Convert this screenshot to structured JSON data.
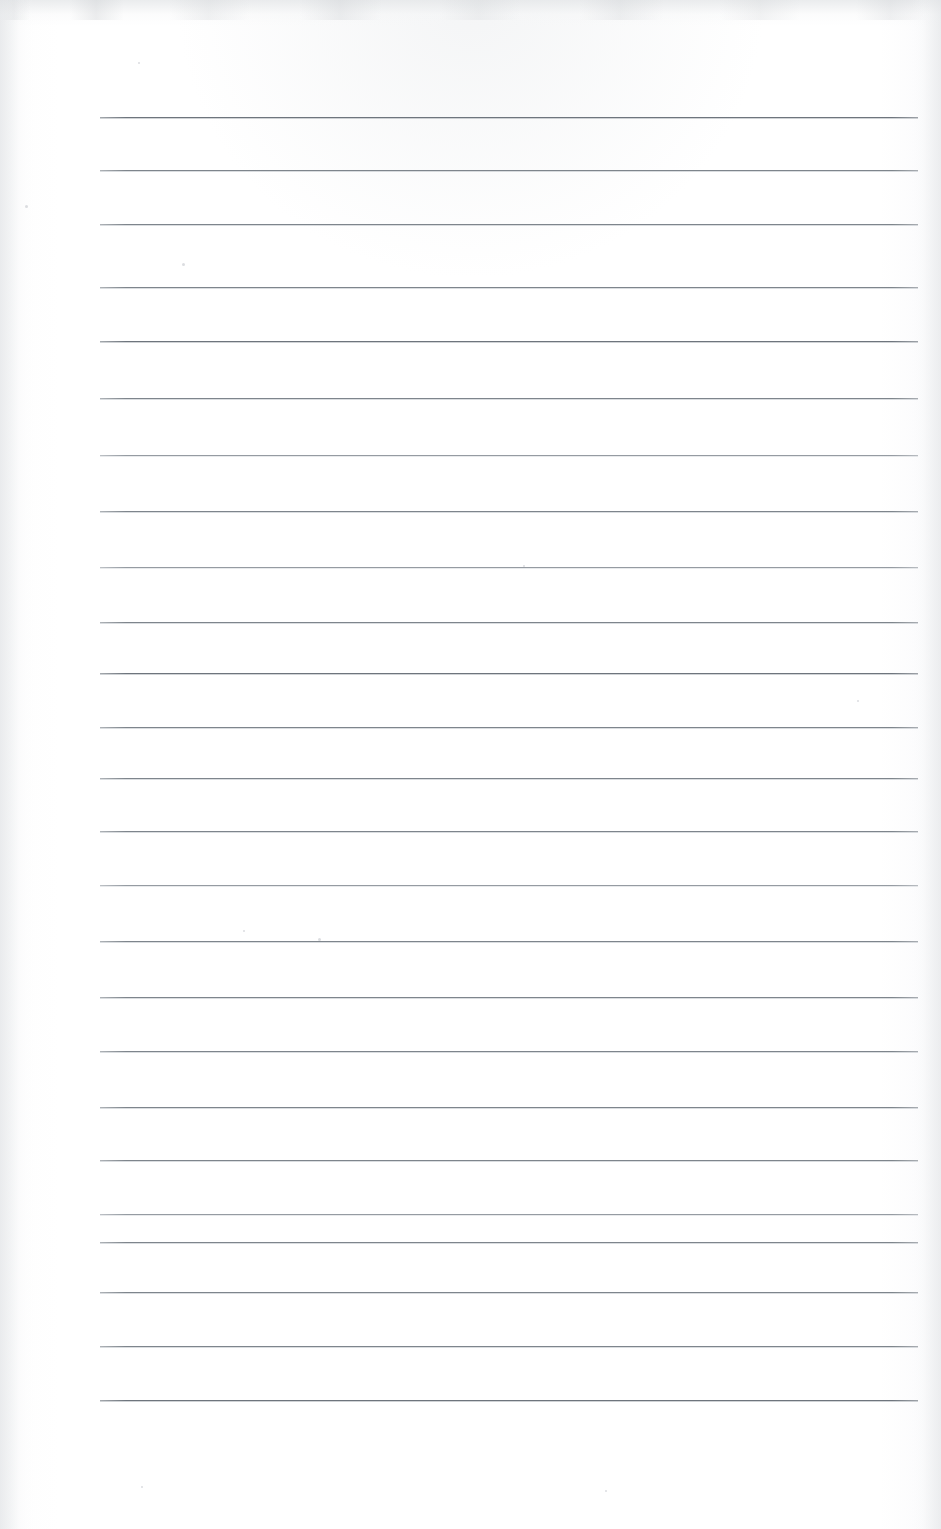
{
  "document": {
    "kind": "scanned-page",
    "content_type": "blank ruled notebook paper",
    "page_width_px": 941,
    "page_height_px": 1529,
    "paper_color": "#fdfdfd",
    "handwriting_present": "none",
    "printed_text_present": "none",
    "visible_text": ""
  },
  "ruling": {
    "line_color": "#7e858c",
    "line_thickness_px": 1,
    "line_count": 25,
    "line_start_x_px": 100,
    "line_end_x_px": 918,
    "line_length_px": 818,
    "first_line_y_px": 117,
    "last_line_y_px": 1400,
    "line_spacing_px": 53.5,
    "margin_rule_present": "none",
    "lines": [
      {
        "index": 1,
        "y": 117,
        "tone": "darker"
      },
      {
        "index": 2,
        "y": 170,
        "tone": "normal"
      },
      {
        "index": 3,
        "y": 224,
        "tone": "normal"
      },
      {
        "index": 4,
        "y": 287,
        "tone": "normal"
      },
      {
        "index": 5,
        "y": 341,
        "tone": "darker"
      },
      {
        "index": 6,
        "y": 398,
        "tone": "normal"
      },
      {
        "index": 7,
        "y": 455,
        "tone": "lighter"
      },
      {
        "index": 8,
        "y": 511,
        "tone": "normal"
      },
      {
        "index": 9,
        "y": 567,
        "tone": "lighter"
      },
      {
        "index": 10,
        "y": 622,
        "tone": "normal"
      },
      {
        "index": 11,
        "y": 673,
        "tone": "darker"
      },
      {
        "index": 12,
        "y": 727,
        "tone": "normal"
      },
      {
        "index": 13,
        "y": 778,
        "tone": "normal"
      },
      {
        "index": 14,
        "y": 831,
        "tone": "normal"
      },
      {
        "index": 15,
        "y": 885,
        "tone": "lighter"
      },
      {
        "index": 16,
        "y": 941,
        "tone": "normal"
      },
      {
        "index": 17,
        "y": 997,
        "tone": "normal"
      },
      {
        "index": 18,
        "y": 1051,
        "tone": "normal"
      },
      {
        "index": 19,
        "y": 1107,
        "tone": "normal"
      },
      {
        "index": 20,
        "y": 1160,
        "tone": "normal"
      },
      {
        "index": 21,
        "y": 1214,
        "tone": "lighter"
      },
      {
        "index": 22,
        "y": 1242,
        "tone": "normal"
      },
      {
        "index": 23,
        "y": 1292,
        "tone": "normal"
      },
      {
        "index": 24,
        "y": 1346,
        "tone": "normal"
      },
      {
        "index": 25,
        "y": 1400,
        "tone": "darker"
      }
    ]
  },
  "scan_artifacts": {
    "top_band_height_px": 26,
    "top_band_color": "#e4e6e8",
    "left_edge_shade_width_px": 34,
    "right_edge_shade_width_px": 30,
    "specks": [
      {
        "x": 25,
        "y": 205,
        "size": 3
      },
      {
        "x": 138,
        "y": 62,
        "size": 2
      },
      {
        "x": 182,
        "y": 263,
        "size": 3
      },
      {
        "x": 243,
        "y": 930,
        "size": 2
      },
      {
        "x": 318,
        "y": 938,
        "size": 3
      },
      {
        "x": 523,
        "y": 565,
        "size": 2
      },
      {
        "x": 857,
        "y": 700,
        "size": 2
      },
      {
        "x": 141,
        "y": 1486,
        "size": 2
      },
      {
        "x": 605,
        "y": 1490,
        "size": 2
      }
    ]
  }
}
